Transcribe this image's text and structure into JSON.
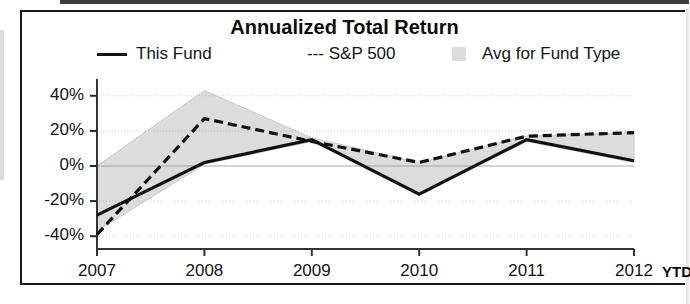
{
  "chart": {
    "title": "Annualized Total Return",
    "legend": {
      "this_fund": "This Fund",
      "sp500": "--- S&P 500",
      "avg_for_fund_type": "Avg for Fund Type"
    },
    "y_axis_ticks": [
      "40%",
      "20%",
      "0%",
      "-20%",
      "-40%"
    ],
    "x_axis_ticks": [
      "2007",
      "2008",
      "2009",
      "2010",
      "2011",
      "2012"
    ],
    "x_axis_suffix": "YTD",
    "colors": {
      "this_fund_line": "#111111",
      "sp500_line": "#111111",
      "avg_band_fill": "#dcdcdc",
      "frame": "#1a1a1a",
      "gridline": "#9a9a9a"
    }
  },
  "chart_data": {
    "type": "line",
    "title": "Annualized Total Return",
    "xlabel": "",
    "ylabel": "",
    "categories": [
      "2007",
      "2008",
      "2009",
      "2010",
      "2011",
      "2012 YTD"
    ],
    "ylim": [
      -45,
      45
    ],
    "yticks": [
      40,
      20,
      0,
      -20,
      -40
    ],
    "grid": true,
    "legend_position": "top",
    "series": [
      {
        "name": "This Fund",
        "style": "solid",
        "values": [
          -28,
          2,
          15,
          -16,
          15,
          3
        ]
      },
      {
        "name": "S&P 500",
        "style": "dashed",
        "values": [
          -39,
          27,
          14,
          2,
          17,
          19
        ]
      },
      {
        "name": "Avg for Fund Type",
        "style": "band",
        "upper": [
          0,
          43,
          16,
          2,
          17,
          19
        ],
        "lower": [
          -37,
          1,
          14,
          -16,
          14,
          2
        ]
      }
    ]
  }
}
